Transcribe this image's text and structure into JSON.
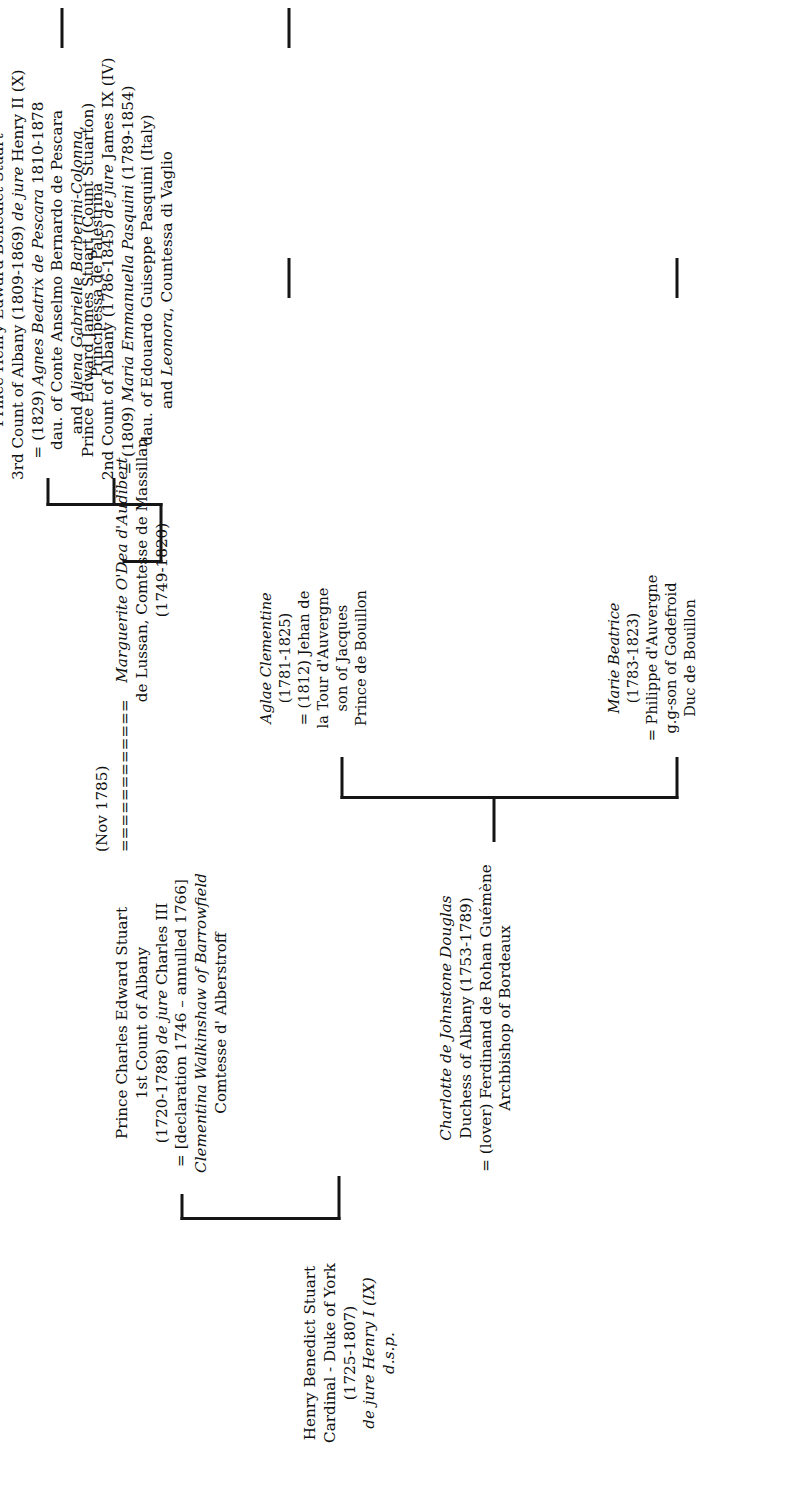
{
  "diagram": {
    "type": "genealogical-family-tree",
    "orientation": "rotated-90-counterclockwise",
    "marriage_label": "(Nov 1785)",
    "marriage_connector": "============",
    "nodes": {
      "henry_benedict": {
        "lines": [
          {
            "text": "Henry Benedict Stuart",
            "italic": false
          },
          {
            "text": "Cardinal - Duke of York",
            "italic": false
          },
          {
            "text": "(1725-1807)",
            "italic": false
          },
          {
            "text": "de jure Henry I (IX)",
            "italic": true
          },
          {
            "text": "d.s.p.",
            "italic": true
          }
        ]
      },
      "charles_edward": {
        "lines": [
          {
            "text": "Prince Charles Edward Stuart",
            "italic": false
          },
          {
            "text": "1st Count of Albany",
            "italic": false
          },
          {
            "text": "(1720-1788) de jure Charles III",
            "italic": false
          },
          {
            "text": "= [declaration 1746 – annulled 1766]",
            "italic": false
          },
          {
            "text": "Clementina Walkinshaw of Barrowfield",
            "italic": true
          },
          {
            "text": "Comtesse d' Alberstroff",
            "italic": false
          }
        ]
      },
      "marguerite": {
        "lines": [
          {
            "text": "Marguerite O'Dea d'Audibert",
            "italic": true
          },
          {
            "text": "de Lussan, Comtesse de Massillan",
            "italic": false
          },
          {
            "text": "(1749-1820)",
            "italic": false
          }
        ]
      },
      "charlotte": {
        "lines": [
          {
            "text": "Charlotte de Johnstone Douglas",
            "italic": true
          },
          {
            "text": "Duchess of Albany (1753-1789)",
            "italic": false
          },
          {
            "text": "= (lover) Ferdinand de Rohan Guémène",
            "italic": false
          },
          {
            "text": "Archbishop of Bordeaux",
            "italic": false
          }
        ]
      },
      "edward_james": {
        "lines": [
          {
            "text": "Prince Edward James Stuart (Count Stuarton)",
            "italic": false
          },
          {
            "text": "2nd Count of Albany (1786-1845) de jure James IX (IV)",
            "italic": false
          },
          {
            "text": "= (1809) Maria Emmanuella Pasquini (1789-1854)",
            "italic": false
          },
          {
            "text": "dau. of Edouardo Guiseppe Pasquini (Italy)",
            "italic": false
          },
          {
            "text": "and Leonora, Countessa di Vaglio",
            "italic": false
          }
        ]
      },
      "henry_edward": {
        "lines": [
          {
            "text": "Prince Henry Edward Benedict Stuart",
            "italic": false
          },
          {
            "text": "3rd Count of Albany (1809-1869) de jure Henry II (X)",
            "italic": false
          },
          {
            "text": "= (1829) Agnes Beatrix de Pescara 1810-1878",
            "italic": false
          },
          {
            "text": "dau. of Conte Anselmo Bernardo de Pescara",
            "italic": false
          },
          {
            "text": "and Aliena Gabrielle Barberini-Colonna,",
            "italic": false
          },
          {
            "text": "Principessa de Palestrina",
            "italic": false
          }
        ]
      },
      "marie_beatrice": {
        "lines": [
          {
            "text": "Marie Beatrice",
            "italic": true
          },
          {
            "text": "(1783-1823)",
            "italic": false
          },
          {
            "text": "= Philippe d'Auvergne",
            "italic": false
          },
          {
            "text": "g.g-son of Godefroid",
            "italic": false
          },
          {
            "text": "Duc de Bouillon",
            "italic": false
          }
        ]
      },
      "aglae_clementine": {
        "lines": [
          {
            "text": "Aglae Clementine",
            "italic": true
          },
          {
            "text": "(1781-1825)",
            "italic": false
          },
          {
            "text": "= (1812) Jehan de",
            "italic": false
          },
          {
            "text": "la Tour d'Auvergne",
            "italic": false
          },
          {
            "text": "son of Jacques",
            "italic": false
          },
          {
            "text": "Prince de Bouillon",
            "italic": false
          }
        ]
      }
    },
    "colors": {
      "ink": "#101010",
      "line": "#151515",
      "background": "#ffffff"
    }
  }
}
